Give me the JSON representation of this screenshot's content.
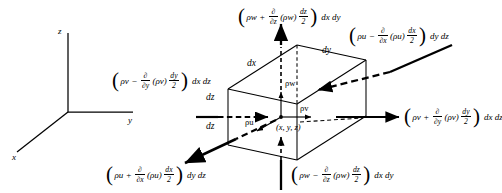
{
  "figure": {
    "type": "control-volume-mass-flux-diagram",
    "axes": {
      "x_label": "x",
      "y_label": "y",
      "z_label": "z"
    },
    "cube": {
      "edge_labels": {
        "dx": "dx",
        "dy": "dy",
        "dz_left": "dz",
        "dz_lower": "dz"
      },
      "center_point_label": "(x, y, z)",
      "center_fluxes": {
        "up": "ρw",
        "right": "ρv",
        "down_left": "ρu"
      }
    },
    "expressions": {
      "top": {
        "name": "top-face-z-flux-out",
        "lead": "ρw",
        "op": "+",
        "partial_num": "∂",
        "partial_den": "∂z",
        "group": "(ρw)",
        "frac_num": "dz",
        "frac_den": "2",
        "tail": "dx dy"
      },
      "bottom_right": {
        "name": "bottom-face-z-flux-in",
        "lead": "ρw",
        "op": "−",
        "partial_num": "∂",
        "partial_den": "∂z",
        "group": "(ρw)",
        "frac_num": "dz",
        "frac_den": "2",
        "tail": "dx dy"
      },
      "left": {
        "name": "back-face-y-flux-in",
        "lead": "ρv",
        "op": "−",
        "partial_num": "∂",
        "partial_den": "∂y",
        "group": "(ρv)",
        "frac_num": "dy",
        "frac_den": "2",
        "tail": "dx dz"
      },
      "right": {
        "name": "front-face-y-flux-out",
        "lead": "ρv",
        "op": "+",
        "partial_num": "∂",
        "partial_den": "∂y",
        "group": "(ρv)",
        "frac_num": "dy",
        "frac_den": "2",
        "tail": "dx dz"
      },
      "top_right": {
        "name": "far-face-x-flux-in",
        "lead": "ρu",
        "op": "−",
        "partial_num": "∂",
        "partial_den": "∂x",
        "group": "(ρu)",
        "frac_num": "dx",
        "frac_den": "2",
        "tail": "dy dz"
      },
      "bottom_left": {
        "name": "near-face-x-flux-out",
        "lead": "ρu",
        "op": "+",
        "partial_num": "∂",
        "partial_den": "∂x",
        "group": "(ρu)",
        "frac_num": "dx",
        "frac_den": "2",
        "tail": "dy dz"
      }
    },
    "colors": {
      "ink": "#000000",
      "background": "#ffffff"
    }
  }
}
